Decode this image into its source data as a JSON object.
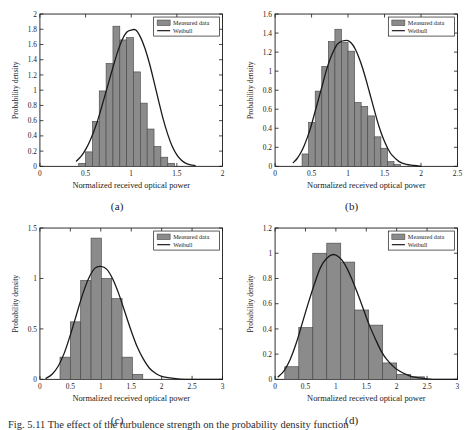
{
  "figure": {
    "caption": "Fig. 5.11  The effect of the turbulence strength on the probability density function",
    "background": "#ffffff"
  },
  "style": {
    "bar_fill": "#8b8b8b",
    "bar_edge": "#4a4a4a",
    "curve_color": "#1a1a1a",
    "axis_color": "#1a1a1a",
    "text_color": "#1a1a1a",
    "legend_bg": "#ffffff"
  },
  "legend": {
    "measured_label": "Measured data",
    "weibull_label": "Weibull",
    "position": "top-right"
  },
  "chart_data": [
    {
      "id": "a",
      "panel_label": "(a)",
      "type": "bar",
      "title": "",
      "xlabel": "Normalized received optical power",
      "ylabel": "Probability density",
      "xlim": [
        0,
        2
      ],
      "ylim": [
        0,
        2
      ],
      "xticks": [
        0,
        0.5,
        1,
        1.5,
        2
      ],
      "xtick_labels": [
        "0",
        "0.5",
        "1",
        "1.5",
        "2"
      ],
      "yticks": [
        0,
        0.2,
        0.4,
        0.6,
        0.8,
        1,
        1.2,
        1.4,
        1.6,
        1.8,
        2
      ],
      "ytick_labels": [
        "0",
        "0.2",
        "0.4",
        "0.6",
        "0.8",
        "1",
        "1.2",
        "1.4",
        "1.6",
        "1.8",
        "2"
      ],
      "grid": false,
      "bin_width": 0.075,
      "bin_start": 0.425,
      "values": [
        0.04,
        0.19,
        0.59,
        0.99,
        1.35,
        1.84,
        1.66,
        1.69,
        1.24,
        0.83,
        0.49,
        0.26,
        0.12,
        0.04
      ],
      "series": [
        {
          "name": "Measured data",
          "type": "bar",
          "bin_edges": [
            0.425,
            0.5,
            0.575,
            0.65,
            0.725,
            0.8,
            0.875,
            0.95,
            1.025,
            1.1,
            1.175,
            1.25,
            1.325,
            1.4,
            1.475
          ],
          "values": [
            0.04,
            0.19,
            0.59,
            0.99,
            1.35,
            1.84,
            1.66,
            1.69,
            1.24,
            0.83,
            0.49,
            0.26,
            0.12,
            0.04
          ]
        },
        {
          "name": "Weibull",
          "type": "line",
          "peak_x": 1.05,
          "peak_y": 1.79,
          "x": [
            0.4,
            0.45,
            0.5,
            0.55,
            0.6,
            0.65,
            0.7,
            0.75,
            0.8,
            0.85,
            0.9,
            0.95,
            1.0,
            1.05,
            1.1,
            1.15,
            1.2,
            1.25,
            1.3,
            1.35,
            1.4,
            1.45,
            1.5,
            1.55,
            1.6,
            1.65,
            1.7
          ],
          "y": [
            0.07,
            0.13,
            0.22,
            0.34,
            0.49,
            0.67,
            0.88,
            1.09,
            1.3,
            1.5,
            1.66,
            1.76,
            1.79,
            1.79,
            1.7,
            1.55,
            1.35,
            1.11,
            0.86,
            0.62,
            0.42,
            0.26,
            0.15,
            0.08,
            0.04,
            0.02,
            0.01
          ]
        }
      ]
    },
    {
      "id": "b",
      "panel_label": "(b)",
      "type": "bar",
      "title": "",
      "xlabel": "Normalized received optical power",
      "ylabel": "Probability density",
      "xlim": [
        0,
        2.5
      ],
      "ylim": [
        0,
        1.6
      ],
      "xticks": [
        0,
        0.5,
        1,
        1.5,
        2,
        2.5
      ],
      "xtick_labels": [
        "0",
        "0.5",
        "1",
        "1.5",
        "2",
        "2.5"
      ],
      "yticks": [
        0,
        0.2,
        0.4,
        0.6,
        0.8,
        1,
        1.2,
        1.4,
        1.6
      ],
      "ytick_labels": [
        "0",
        "0.2",
        "0.4",
        "0.6",
        "0.8",
        "1",
        "1.2",
        "1.4",
        "1.6"
      ],
      "grid": false,
      "bin_width": 0.09,
      "bin_start": 0.37,
      "values": [
        0.13,
        0.46,
        0.79,
        1.05,
        1.31,
        1.44,
        1.3,
        1.21,
        0.67,
        0.63,
        0.53,
        0.31,
        0.19,
        0.05,
        0.02
      ],
      "series": [
        {
          "name": "Measured data",
          "type": "bar",
          "bin_edges": [
            0.37,
            0.46,
            0.55,
            0.64,
            0.73,
            0.82,
            0.91,
            1.0,
            1.09,
            1.18,
            1.27,
            1.36,
            1.45,
            1.54,
            1.63,
            1.72
          ],
          "values": [
            0.13,
            0.46,
            0.79,
            1.05,
            1.31,
            1.44,
            1.3,
            1.21,
            0.67,
            0.63,
            0.53,
            0.31,
            0.19,
            0.05,
            0.02
          ]
        },
        {
          "name": "Weibull",
          "type": "line",
          "peak_x": 1.02,
          "peak_y": 1.32,
          "x": [
            0.25,
            0.3,
            0.35,
            0.4,
            0.45,
            0.5,
            0.55,
            0.6,
            0.65,
            0.7,
            0.75,
            0.8,
            0.85,
            0.9,
            0.95,
            1.0,
            1.05,
            1.1,
            1.15,
            1.2,
            1.25,
            1.3,
            1.35,
            1.4,
            1.45,
            1.5,
            1.55,
            1.6,
            1.7,
            1.8,
            1.9,
            2.0
          ],
          "y": [
            0.04,
            0.08,
            0.14,
            0.22,
            0.32,
            0.44,
            0.58,
            0.72,
            0.86,
            1.0,
            1.12,
            1.21,
            1.28,
            1.31,
            1.32,
            1.32,
            1.29,
            1.23,
            1.14,
            1.03,
            0.9,
            0.76,
            0.62,
            0.48,
            0.36,
            0.26,
            0.18,
            0.12,
            0.05,
            0.02,
            0.01,
            0.0
          ]
        }
      ]
    },
    {
      "id": "c",
      "panel_label": "(c)",
      "type": "bar",
      "title": "",
      "xlabel": "Normalized received optical power",
      "ylabel": "Probability density",
      "xlim": [
        0,
        3
      ],
      "ylim": [
        0,
        1.5
      ],
      "xticks": [
        0,
        0.5,
        1,
        1.5,
        2,
        2.5,
        3
      ],
      "xtick_labels": [
        "0",
        "0.5",
        "1",
        "1.5",
        "2",
        "2.5",
        "3"
      ],
      "yticks": [
        0,
        0.5,
        1,
        1.5
      ],
      "ytick_labels": [
        "0",
        "0.5",
        "1",
        "1.5"
      ],
      "grid": false,
      "bin_width": 0.17,
      "bin_start": 0.33,
      "values": [
        0.22,
        0.57,
        0.98,
        1.4,
        1.0,
        0.8,
        0.22,
        0.05
      ],
      "series": [
        {
          "name": "Measured data",
          "type": "bar",
          "bin_edges": [
            0.33,
            0.5,
            0.67,
            0.84,
            1.01,
            1.18,
            1.35,
            1.52,
            1.69
          ],
          "values": [
            0.22,
            0.57,
            0.98,
            1.4,
            1.0,
            0.8,
            0.22,
            0.05
          ]
        },
        {
          "name": "Weibull",
          "type": "line",
          "peak_x": 1.0,
          "peak_y": 1.12,
          "x": [
            0.1,
            0.2,
            0.3,
            0.4,
            0.5,
            0.6,
            0.7,
            0.8,
            0.9,
            1.0,
            1.1,
            1.2,
            1.3,
            1.4,
            1.5,
            1.6,
            1.7,
            1.8,
            1.9,
            2.0,
            2.2,
            2.4,
            2.6,
            2.8,
            3.0
          ],
          "y": [
            0.01,
            0.05,
            0.13,
            0.26,
            0.44,
            0.64,
            0.84,
            1.0,
            1.1,
            1.12,
            1.09,
            0.99,
            0.84,
            0.66,
            0.48,
            0.32,
            0.2,
            0.11,
            0.06,
            0.03,
            0.01,
            0.0,
            0.0,
            0.0,
            0.0
          ]
        }
      ]
    },
    {
      "id": "d",
      "panel_label": "(d)",
      "type": "bar",
      "title": "",
      "xlabel": "Normalized received optical power",
      "ylabel": "Probability density",
      "xlim": [
        0,
        3
      ],
      "ylim": [
        0,
        1.2
      ],
      "xticks": [
        0,
        0.5,
        1,
        1.5,
        2,
        2.5,
        3
      ],
      "xtick_labels": [
        "0",
        "0.5",
        "1",
        "1.5",
        "2",
        "2.5",
        "3"
      ],
      "yticks": [
        0,
        0.2,
        0.4,
        0.6,
        0.8,
        1,
        1.2
      ],
      "ytick_labels": [
        "0",
        "0.2",
        "0.4",
        "0.6",
        "0.8",
        "1",
        "1.2"
      ],
      "grid": false,
      "bin_width": 0.23,
      "bin_start": 0.16,
      "values": [
        0.1,
        0.41,
        1.0,
        1.08,
        0.93,
        0.55,
        0.43,
        0.13,
        0.04,
        0.02
      ],
      "series": [
        {
          "name": "Measured data",
          "type": "bar",
          "bin_edges": [
            0.16,
            0.39,
            0.62,
            0.85,
            1.08,
            1.31,
            1.54,
            1.77,
            2.0,
            2.23,
            2.46
          ],
          "values": [
            0.1,
            0.41,
            1.0,
            1.08,
            0.93,
            0.55,
            0.43,
            0.13,
            0.04,
            0.02
          ]
        },
        {
          "name": "Weibull",
          "type": "line",
          "peak_x": 0.95,
          "peak_y": 0.99,
          "x": [
            0.05,
            0.15,
            0.25,
            0.35,
            0.45,
            0.55,
            0.65,
            0.75,
            0.85,
            0.95,
            1.05,
            1.15,
            1.25,
            1.35,
            1.45,
            1.55,
            1.65,
            1.75,
            1.85,
            2.0,
            2.2,
            2.4,
            2.6,
            2.8,
            3.0
          ],
          "y": [
            0.02,
            0.07,
            0.16,
            0.29,
            0.45,
            0.61,
            0.76,
            0.89,
            0.96,
            0.99,
            0.97,
            0.91,
            0.81,
            0.69,
            0.56,
            0.43,
            0.32,
            0.22,
            0.15,
            0.08,
            0.03,
            0.01,
            0.0,
            0.0,
            0.0
          ]
        }
      ]
    }
  ]
}
